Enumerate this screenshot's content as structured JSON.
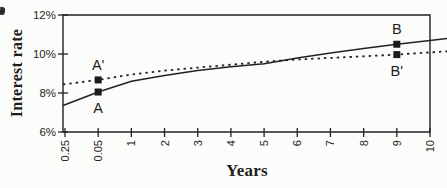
{
  "figure": {
    "background": "#fcfcfa",
    "ink": "#222222"
  },
  "chart_data": {
    "type": "line",
    "title": "",
    "xlabel": "Years",
    "ylabel": "Interest rate",
    "x_tick_labels": [
      "0.25",
      "0.05",
      "1",
      "2",
      "3",
      "4",
      "5",
      "6",
      "7",
      "8",
      "9",
      "10"
    ],
    "y_tick_labels": [
      "6%",
      "8%",
      "10%",
      "12%"
    ],
    "y_tick_values": [
      6,
      8,
      10,
      12
    ],
    "ylim": [
      6,
      12
    ],
    "grid": false,
    "legend": "none",
    "series": [
      {
        "name": "solid-curve",
        "style": "solid",
        "values": [
          7.4,
          8.05,
          8.6,
          8.9,
          9.15,
          9.35,
          9.5,
          9.8,
          10.05,
          10.28,
          10.5,
          10.7
        ]
      },
      {
        "name": "dashed-curve",
        "style": "dashed",
        "values": [
          8.45,
          8.67,
          8.95,
          9.15,
          9.3,
          9.45,
          9.6,
          9.72,
          9.8,
          9.88,
          9.97,
          10.08
        ]
      }
    ],
    "points": [
      {
        "label": "A",
        "x_index": 1,
        "value": 8.05,
        "label_position": "below"
      },
      {
        "label": "A'",
        "x_index": 1,
        "value": 8.67,
        "label_position": "above"
      },
      {
        "label": "B",
        "x_index": 10,
        "value": 10.5,
        "label_position": "above"
      },
      {
        "label": "B'",
        "x_index": 10,
        "value": 9.97,
        "label_position": "below"
      }
    ]
  }
}
